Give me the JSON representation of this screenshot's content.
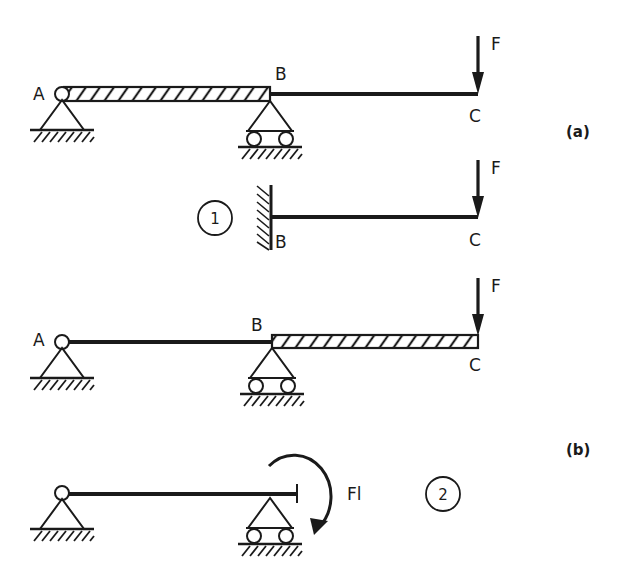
{
  "figure": {
    "panel_a": {
      "caption": "(a)",
      "original": {
        "labels": {
          "A": "A",
          "B": "B",
          "C": "C",
          "force": "F"
        },
        "hatched_segment": "AB"
      },
      "subsystem_1": {
        "number": "1",
        "labels": {
          "B": "B",
          "C": "C",
          "force": "F"
        },
        "support_B": "fixed wall"
      }
    },
    "panel_b": {
      "caption": "(b)",
      "original": {
        "labels": {
          "A": "A",
          "B": "B",
          "C": "C",
          "force": "F"
        },
        "hatched_segment": "BC"
      },
      "subsystem_2": {
        "number": "2",
        "moment_label": "Fl",
        "moment_direction": "clockwise"
      }
    },
    "colors": {
      "ink": "#1a1a1a",
      "background": "#ffffff"
    }
  }
}
